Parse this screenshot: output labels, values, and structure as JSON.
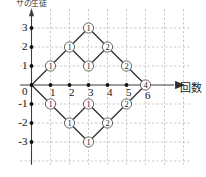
{
  "figure": {
    "type": "lattice-path-diagram",
    "y_axis_caption": "サの生徒",
    "x_axis_caption": "回数",
    "origin_label": "0"
  },
  "axes": {
    "x_ticks": [
      {
        "value": 1,
        "label": "1"
      },
      {
        "value": 2,
        "label": "2"
      },
      {
        "value": 3,
        "label": "3"
      },
      {
        "value": 4,
        "label": "4"
      },
      {
        "value": 5,
        "label": "5"
      },
      {
        "value": 6,
        "label": "6"
      }
    ],
    "y_ticks": [
      {
        "value": 3,
        "label": "3"
      },
      {
        "value": 2,
        "label": "2"
      },
      {
        "value": 1,
        "label": "1"
      },
      {
        "value": -1,
        "label": "-1"
      },
      {
        "value": -2,
        "label": "-2"
      },
      {
        "value": -3,
        "label": "-3"
      }
    ],
    "xlim": [
      -0.6,
      8.4
    ],
    "ylim": [
      -4.2,
      4.0
    ],
    "grid": "dashed"
  },
  "chart_data": {
    "type": "scatter",
    "title": "",
    "xlabel": "回数",
    "ylabel": "サの生徒",
    "nodes": [
      {
        "x": 0,
        "y": 0,
        "label": "",
        "circled": false
      },
      {
        "x": 1,
        "y": 1,
        "label": "1",
        "circled": true
      },
      {
        "x": 1,
        "y": -1,
        "label": "1",
        "circled": true
      },
      {
        "x": 2,
        "y": 2,
        "label": "1",
        "circled": true
      },
      {
        "x": 2,
        "y": -2,
        "label": "1",
        "circled": true
      },
      {
        "x": 3,
        "y": 3,
        "label": "1",
        "circled": true
      },
      {
        "x": 3,
        "y": 1,
        "label": "1",
        "circled": true
      },
      {
        "x": 3,
        "y": -1,
        "label": "1",
        "circled": true
      },
      {
        "x": 3,
        "y": -3,
        "label": "1",
        "circled": true
      },
      {
        "x": 4,
        "y": 2,
        "label": "2",
        "circled": true
      },
      {
        "x": 4,
        "y": -2,
        "label": "2",
        "circled": true
      },
      {
        "x": 5,
        "y": 1,
        "label": "2",
        "circled": true
      },
      {
        "x": 5,
        "y": -1,
        "label": "2",
        "circled": true
      },
      {
        "x": 6,
        "y": 0,
        "label": "4",
        "circled": true
      }
    ],
    "edges": [
      {
        "from": [
          0,
          0
        ],
        "to": [
          1,
          1
        ]
      },
      {
        "from": [
          0,
          0
        ],
        "to": [
          1,
          -1
        ]
      },
      {
        "from": [
          1,
          1
        ],
        "to": [
          2,
          2
        ]
      },
      {
        "from": [
          1,
          -1
        ],
        "to": [
          2,
          -2
        ]
      },
      {
        "from": [
          2,
          2
        ],
        "to": [
          3,
          3
        ]
      },
      {
        "from": [
          2,
          2
        ],
        "to": [
          3,
          1
        ]
      },
      {
        "from": [
          2,
          -2
        ],
        "to": [
          3,
          -1
        ]
      },
      {
        "from": [
          2,
          -2
        ],
        "to": [
          3,
          -3
        ]
      },
      {
        "from": [
          3,
          3
        ],
        "to": [
          4,
          2
        ]
      },
      {
        "from": [
          3,
          1
        ],
        "to": [
          4,
          2
        ]
      },
      {
        "from": [
          3,
          -1
        ],
        "to": [
          4,
          -2
        ]
      },
      {
        "from": [
          3,
          -3
        ],
        "to": [
          4,
          -2
        ]
      },
      {
        "from": [
          4,
          2
        ],
        "to": [
          5,
          1
        ]
      },
      {
        "from": [
          4,
          -2
        ],
        "to": [
          5,
          -1
        ]
      },
      {
        "from": [
          5,
          1
        ],
        "to": [
          6,
          0
        ]
      },
      {
        "from": [
          5,
          -1
        ],
        "to": [
          6,
          0
        ]
      }
    ],
    "axis_dots": [
      {
        "x": 1,
        "y": 0
      },
      {
        "x": 2,
        "y": 0
      },
      {
        "x": 3,
        "y": 0
      },
      {
        "x": 4,
        "y": 0
      },
      {
        "x": 5,
        "y": 0
      }
    ],
    "y_axis_dots": [
      {
        "x": 0,
        "y": 3
      },
      {
        "x": 0,
        "y": 2
      },
      {
        "x": 0,
        "y": 1
      },
      {
        "x": 0,
        "y": -1
      },
      {
        "x": 0,
        "y": -2
      },
      {
        "x": 0,
        "y": -3
      }
    ]
  },
  "colors": {
    "axis": "#3c3c3c",
    "grid": "#b9b9b9",
    "edge": "#2b2b2b",
    "node_fill": "#ffffff",
    "node_stroke": "#555555",
    "text": "#111111"
  }
}
